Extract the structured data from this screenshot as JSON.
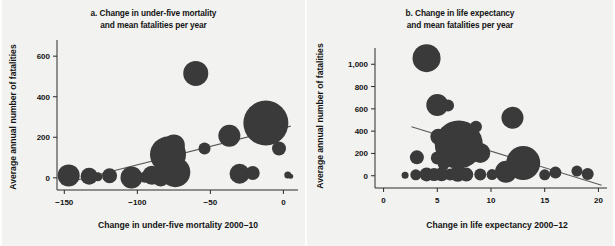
{
  "figure": {
    "background_color": "#f2f2f0",
    "bubble_color": "#3a3a3a",
    "trend_color": "#5a5a5a",
    "axis_color": "#2a2a2a"
  },
  "chart_data": [
    {
      "id": "panel-a",
      "type": "scatter",
      "title_line1": "a. Change in under-five mortality",
      "title_line2": "and mean fatalities per year",
      "xlabel": "Change in under-five mortality 2000–10",
      "ylabel": "Average annual number of fatalities",
      "xlim": [
        -155,
        10
      ],
      "ylim": [
        -60,
        660
      ],
      "xticks": [
        -150,
        -100,
        -50,
        0
      ],
      "xtick_labels": [
        "−150",
        "−100",
        "−50",
        "0"
      ],
      "yticks": [
        0,
        200,
        400,
        600
      ],
      "ytick_labels": [
        "0",
        "200",
        "400",
        "600"
      ],
      "grid": false,
      "legend": "none",
      "trend": {
        "x1": -152,
        "y1": -30,
        "x2": 5,
        "y2": 255
      },
      "points": [
        {
          "x": -147,
          "y": 12,
          "size": 22
        },
        {
          "x": -133,
          "y": 8,
          "size": 17
        },
        {
          "x": -127,
          "y": 5,
          "size": 9
        },
        {
          "x": -119,
          "y": 10,
          "size": 15
        },
        {
          "x": -104,
          "y": 2,
          "size": 22
        },
        {
          "x": -95,
          "y": 3,
          "size": 11
        },
        {
          "x": -90,
          "y": 13,
          "size": 19
        },
        {
          "x": -84,
          "y": 2,
          "size": 18
        },
        {
          "x": -79,
          "y": 115,
          "size": 36
        },
        {
          "x": -75,
          "y": 160,
          "size": 22
        },
        {
          "x": -74,
          "y": 28,
          "size": 30
        },
        {
          "x": -60,
          "y": 515,
          "size": 25
        },
        {
          "x": -54,
          "y": 145,
          "size": 12
        },
        {
          "x": -37,
          "y": 208,
          "size": 22
        },
        {
          "x": -30,
          "y": 20,
          "size": 20
        },
        {
          "x": -21,
          "y": 24,
          "size": 14
        },
        {
          "x": -12,
          "y": 270,
          "size": 45
        },
        {
          "x": -3,
          "y": 145,
          "size": 14
        },
        {
          "x": 3,
          "y": 14,
          "size": 7
        },
        {
          "x": 5,
          "y": 8,
          "size": 5
        }
      ]
    },
    {
      "id": "panel-b",
      "type": "scatter",
      "title_line1": "b. Change in life expectancy",
      "title_line2": "and mean fatalities per year",
      "xlabel": "Change in life expectancy 2000–12",
      "ylabel": "Average annual number of fatalities",
      "xlim": [
        -0.8,
        20.8
      ],
      "ylim": [
        -110,
        1110
      ],
      "xticks": [
        0,
        5,
        10,
        15,
        20
      ],
      "xtick_labels": [
        "0",
        "5",
        "10",
        "15",
        "20"
      ],
      "yticks": [
        0,
        200,
        400,
        600,
        800,
        1000
      ],
      "ytick_labels": [
        "0",
        "200",
        "400",
        "600",
        "800",
        "1,000"
      ],
      "grid": false,
      "legend": "none",
      "trend": {
        "x1": 2.6,
        "y1": 440,
        "x2": 20.3,
        "y2": -85
      },
      "points": [
        {
          "x": 4.0,
          "y": 1055,
          "size": 28
        },
        {
          "x": 5.0,
          "y": 635,
          "size": 22
        },
        {
          "x": 6.0,
          "y": 630,
          "size": 12
        },
        {
          "x": 12.0,
          "y": 520,
          "size": 22
        },
        {
          "x": 8.6,
          "y": 440,
          "size": 12
        },
        {
          "x": 5.1,
          "y": 350,
          "size": 16
        },
        {
          "x": 7.0,
          "y": 280,
          "size": 48
        },
        {
          "x": 9.0,
          "y": 205,
          "size": 20
        },
        {
          "x": 3.1,
          "y": 165,
          "size": 14
        },
        {
          "x": 5.0,
          "y": 160,
          "size": 13
        },
        {
          "x": 5.6,
          "y": 105,
          "size": 12
        },
        {
          "x": 6.4,
          "y": 120,
          "size": 11
        },
        {
          "x": 13.0,
          "y": 115,
          "size": 34
        },
        {
          "x": 11.4,
          "y": 35,
          "size": 22
        },
        {
          "x": 2.0,
          "y": 5,
          "size": 7
        },
        {
          "x": 3.0,
          "y": 8,
          "size": 11
        },
        {
          "x": 4.0,
          "y": 12,
          "size": 14
        },
        {
          "x": 4.7,
          "y": 10,
          "size": 13
        },
        {
          "x": 5.4,
          "y": 14,
          "size": 14
        },
        {
          "x": 6.2,
          "y": 10,
          "size": 12
        },
        {
          "x": 6.9,
          "y": 18,
          "size": 16
        },
        {
          "x": 7.7,
          "y": 10,
          "size": 14
        },
        {
          "x": 9.0,
          "y": 12,
          "size": 12
        },
        {
          "x": 10.1,
          "y": 10,
          "size": 11
        },
        {
          "x": 15.0,
          "y": 8,
          "size": 11
        },
        {
          "x": 16.0,
          "y": 28,
          "size": 12
        },
        {
          "x": 18.0,
          "y": 42,
          "size": 11
        },
        {
          "x": 19.0,
          "y": 15,
          "size": 12
        }
      ]
    }
  ]
}
